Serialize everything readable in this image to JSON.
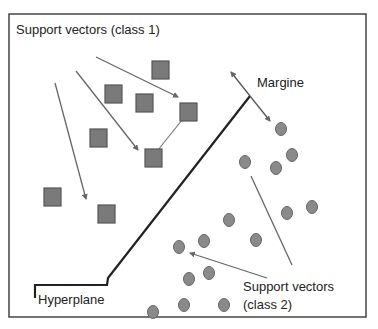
{
  "diagram": {
    "type": "svm-illustration",
    "labels": {
      "support_vectors_class1": "Support vectors (class 1)",
      "margin": "Margine",
      "hyperplane": "Hyperplane",
      "support_vectors_class2_line1": "Support vectors",
      "support_vectors_class2_line2": "(class 2)"
    },
    "colors": {
      "frame": "#444444",
      "square_fill": "#7a7a7a",
      "square_stroke": "#555555",
      "circle_fill": "#8a8a8a",
      "circle_stroke": "#666666",
      "hyperplane": "#222222",
      "arrow": "#666666"
    },
    "class1_squares": [
      {
        "x": 152,
        "y": 61
      },
      {
        "x": 105,
        "y": 85
      },
      {
        "x": 136,
        "y": 94
      },
      {
        "x": 180,
        "y": 103
      },
      {
        "x": 90,
        "y": 129
      },
      {
        "x": 145,
        "y": 149
      },
      {
        "x": 44,
        "y": 188
      },
      {
        "x": 98,
        "y": 205
      }
    ],
    "class2_circles": [
      {
        "x": 281,
        "y": 129
      },
      {
        "x": 292,
        "y": 155
      },
      {
        "x": 245,
        "y": 162
      },
      {
        "x": 276,
        "y": 168
      },
      {
        "x": 312,
        "y": 207
      },
      {
        "x": 287,
        "y": 213
      },
      {
        "x": 229,
        "y": 220
      },
      {
        "x": 204,
        "y": 241
      },
      {
        "x": 256,
        "y": 240
      },
      {
        "x": 179,
        "y": 247
      },
      {
        "x": 209,
        "y": 273
      },
      {
        "x": 189,
        "y": 279
      },
      {
        "x": 184,
        "y": 305
      },
      {
        "x": 224,
        "y": 305
      },
      {
        "x": 153,
        "y": 312
      }
    ]
  }
}
